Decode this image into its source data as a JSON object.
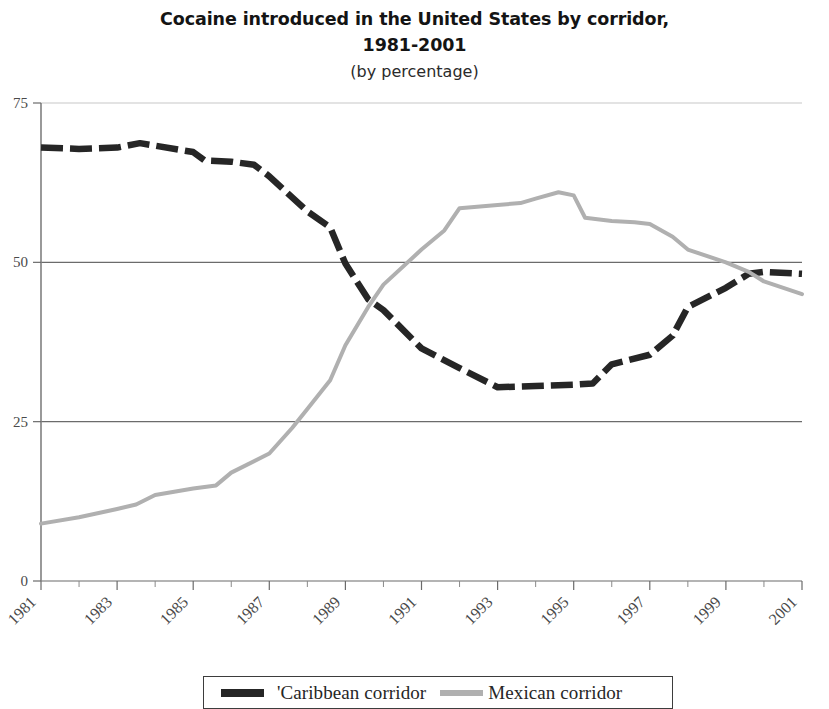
{
  "figure": {
    "title_line1": "Cocaine introduced in the United States by corridor,",
    "title_line2": "1981-2001",
    "subtitle": "(by percentage)"
  },
  "legend": {
    "marker_prefix": "'",
    "entries": [
      {
        "label": "Caribbean corridor",
        "color": "#262626",
        "style": "dashed-thick"
      },
      {
        "label": "Mexican corridor",
        "color": "#b0b0b0",
        "style": "solid-thin"
      }
    ]
  },
  "chart_data": {
    "type": "line",
    "title": "Cocaine introduced in the United States by corridor, 1981-2001",
    "subtitle": "(by percentage)",
    "xlabel": "",
    "ylabel": "",
    "xlim": [
      1981,
      2001
    ],
    "ylim": [
      0,
      75
    ],
    "yticks": [
      0,
      25,
      50,
      75
    ],
    "ytick_labels": [
      "0",
      "25",
      "50",
      "75"
    ],
    "xticks": [
      1981,
      1983,
      1985,
      1987,
      1989,
      1991,
      1993,
      1995,
      1997,
      1999,
      2001
    ],
    "xtick_labels": [
      "1981",
      "1983",
      "1985",
      "1987",
      "1989",
      "1991",
      "1993",
      "1995",
      "1997",
      "1999",
      "2001"
    ],
    "xtick_rotation": 45,
    "minor_xticks": [
      1982,
      1984,
      1986,
      1988,
      1990,
      1992,
      1994,
      1996,
      1998,
      2000
    ],
    "grid": "horizontal",
    "legend_position": "bottom",
    "x": [
      1981,
      1982,
      1983,
      1984,
      1985,
      1986,
      1987,
      1988,
      1989,
      1990,
      1991,
      1992,
      1993,
      1994,
      1995,
      1996,
      1997,
      1998,
      1999,
      2000,
      2001
    ],
    "series": [
      {
        "name": "Caribbean corridor",
        "color": "#262626",
        "values": [
          68,
          67.5,
          68,
          68.5,
          67,
          66,
          63.5,
          59,
          55,
          50,
          45,
          37,
          33.5,
          30.5,
          30.5,
          31,
          31,
          35,
          37,
          39,
          44.5
        ]
      },
      {
        "name": "Mexican corridor",
        "color": "#b0b0b0",
        "values": [
          9,
          10,
          11,
          12,
          14.5,
          15,
          18.5,
          24,
          28,
          32,
          44,
          50,
          56,
          59,
          59,
          61,
          57,
          56.5,
          55,
          50,
          48
        ]
      }
    ],
    "series_extra_points": {
      "Caribbean corridor": [
        [
          1981,
          68
        ],
        [
          1982,
          67.8
        ],
        [
          1983,
          68
        ],
        [
          1983.6,
          68.7
        ],
        [
          1985,
          67.3
        ],
        [
          1985.3,
          66
        ],
        [
          1986,
          65.8
        ],
        [
          1986.6,
          65.3
        ],
        [
          1987,
          63.5
        ],
        [
          1988,
          58
        ],
        [
          1988.6,
          55.5
        ],
        [
          1989,
          49.8
        ],
        [
          1989.6,
          44.2
        ],
        [
          1990,
          42.5
        ],
        [
          1991,
          36.5
        ],
        [
          1992,
          33.4
        ],
        [
          1993,
          30.4
        ],
        [
          1994,
          30.6
        ],
        [
          1995,
          30.8
        ],
        [
          1995.5,
          31
        ],
        [
          1996,
          34
        ],
        [
          1997,
          35.5
        ],
        [
          1997.6,
          38.5
        ],
        [
          1998,
          43
        ],
        [
          1999,
          46
        ],
        [
          1999.6,
          48.2
        ],
        [
          2000,
          48.5
        ],
        [
          2001,
          48.2
        ]
      ],
      "Mexican corridor": [
        [
          1981,
          9
        ],
        [
          1982,
          10
        ],
        [
          1983,
          11.3
        ],
        [
          1983.5,
          12
        ],
        [
          1984,
          13.5
        ],
        [
          1985,
          14.5
        ],
        [
          1985.6,
          15
        ],
        [
          1986,
          17
        ],
        [
          1987,
          20
        ],
        [
          1987.6,
          24
        ],
        [
          1988,
          27
        ],
        [
          1988.6,
          31.5
        ],
        [
          1989,
          37
        ],
        [
          1989.6,
          43
        ],
        [
          1990,
          46.5
        ],
        [
          1991,
          52
        ],
        [
          1991.6,
          55
        ],
        [
          1992,
          58.5
        ],
        [
          1993,
          59
        ],
        [
          1993.6,
          59.3
        ],
        [
          1994,
          60
        ],
        [
          1994.6,
          61
        ],
        [
          1995,
          60.5
        ],
        [
          1995.3,
          57
        ],
        [
          1996,
          56.5
        ],
        [
          1996.6,
          56.3
        ],
        [
          1997,
          56
        ],
        [
          1997.6,
          54
        ],
        [
          1998,
          52
        ],
        [
          1999,
          50
        ],
        [
          1999.6,
          48.5
        ],
        [
          2000,
          47
        ],
        [
          2001,
          45
        ]
      ]
    },
    "annotations": []
  },
  "axes_geometry": {
    "plot_left_px": 41,
    "plot_right_px": 802,
    "plot_top_px": 103,
    "plot_bottom_px": 581
  }
}
